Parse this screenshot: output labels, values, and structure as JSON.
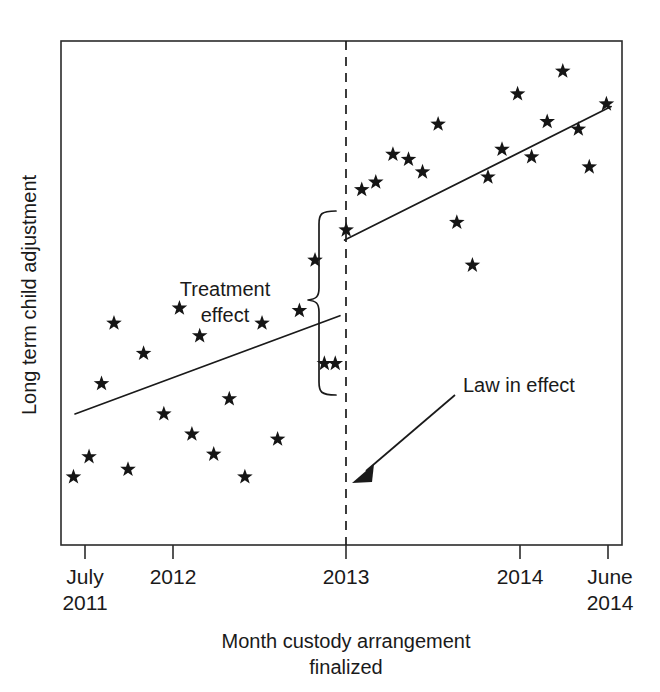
{
  "chart_data": {
    "type": "scatter",
    "title": "",
    "subtitle": "",
    "xlabel": "Month custody arrangement finalized",
    "xlabel_line1": "Month custody arrangement",
    "xlabel_line2": "finalized",
    "ylabel": "Long term child adjustment",
    "grid": false,
    "legend": "none",
    "xlim": [
      0,
      36
    ],
    "ylim": [
      0,
      100
    ],
    "x_tick_labels": [
      {
        "line1": "July",
        "line2": "2011",
        "x": 0.5
      },
      {
        "line1": "2012",
        "line2": "",
        "x": 6
      },
      {
        "line1": "2013",
        "line2": "",
        "x": 18
      },
      {
        "line1": "2014",
        "line2": "",
        "x": 30
      },
      {
        "line1": "June",
        "line2": "2014",
        "x": 35.5
      }
    ],
    "y_tick_labels": [],
    "cutpoint": {
      "x": 18,
      "label": "2013",
      "style": "dashed-vertical"
    },
    "annotations": [
      {
        "name": "treatment-effect",
        "text": "Treatment effect",
        "line1": "Treatment",
        "line2": "effect",
        "marker": "curly-brace",
        "description": "Vertical brace spanning the discontinuity gap at the cutpoint"
      },
      {
        "name": "law-in-effect",
        "text": "Law in effect",
        "marker": "arrow",
        "description": "Arrow pointing to the dashed vertical cutpoint line"
      }
    ],
    "series": [
      {
        "name": "Pre-law observations",
        "marker": "star",
        "points": [
          {
            "x": 0.8,
            "y": 13.5
          },
          {
            "x": 1.8,
            "y": 17.5
          },
          {
            "x": 2.6,
            "y": 32.0
          },
          {
            "x": 3.4,
            "y": 44.0
          },
          {
            "x": 4.3,
            "y": 15.0
          },
          {
            "x": 5.3,
            "y": 38.0
          },
          {
            "x": 6.6,
            "y": 26.0
          },
          {
            "x": 7.6,
            "y": 47.0
          },
          {
            "x": 8.4,
            "y": 22.0
          },
          {
            "x": 8.9,
            "y": 41.5
          },
          {
            "x": 9.8,
            "y": 18.0
          },
          {
            "x": 10.8,
            "y": 29.0
          },
          {
            "x": 11.8,
            "y": 13.5
          },
          {
            "x": 12.9,
            "y": 44.0
          },
          {
            "x": 13.9,
            "y": 21.0
          },
          {
            "x": 15.3,
            "y": 46.5
          },
          {
            "x": 16.3,
            "y": 56.5
          },
          {
            "x": 16.9,
            "y": 36.0
          },
          {
            "x": 17.6,
            "y": 36.0
          }
        ]
      },
      {
        "name": "Post-law observations",
        "marker": "star",
        "points": [
          {
            "x": 18.3,
            "y": 62.5
          },
          {
            "x": 19.3,
            "y": 70.5
          },
          {
            "x": 20.2,
            "y": 72.0
          },
          {
            "x": 21.3,
            "y": 77.5
          },
          {
            "x": 22.3,
            "y": 76.5
          },
          {
            "x": 23.2,
            "y": 74.0
          },
          {
            "x": 24.2,
            "y": 83.5
          },
          {
            "x": 25.4,
            "y": 64.0
          },
          {
            "x": 26.4,
            "y": 55.5
          },
          {
            "x": 27.4,
            "y": 73.0
          },
          {
            "x": 28.3,
            "y": 78.5
          },
          {
            "x": 29.3,
            "y": 89.5
          },
          {
            "x": 30.2,
            "y": 77.0
          },
          {
            "x": 31.2,
            "y": 84.0
          },
          {
            "x": 32.2,
            "y": 94.0
          },
          {
            "x": 33.2,
            "y": 82.5
          },
          {
            "x": 33.9,
            "y": 75.0
          },
          {
            "x": 35.0,
            "y": 87.5
          }
        ]
      }
    ],
    "fit_lines": [
      {
        "name": "Pre-law trend",
        "x_start": 0.9,
        "y_start": 26.0,
        "x_end": 17.9,
        "y_end": 45.5
      },
      {
        "name": "Post-law trend",
        "x_start": 18.2,
        "y_start": 60.5,
        "x_end": 35.3,
        "y_end": 87.0
      }
    ]
  },
  "figure": {
    "y_axis_label": "Long term child adjustment",
    "x_axis_label_line1": "Month custody arrangement",
    "x_axis_label_line2": "finalized",
    "tick_july": "July",
    "tick_2011": "2011",
    "tick_2012": "2012",
    "tick_2013": "2013",
    "tick_2014_mid": "2014",
    "tick_june": "June",
    "tick_2014_end": "2014",
    "treatment_line1": "Treatment",
    "treatment_line2": "effect",
    "law_label": "Law in effect",
    "colors": {
      "ink": "#1a1a1a",
      "frame": "#2b2b2b",
      "background": "#ffffff"
    }
  }
}
